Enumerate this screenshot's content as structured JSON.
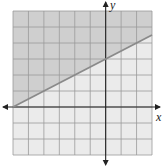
{
  "chart_data": {
    "type": "line",
    "title": "",
    "xlabel": "x",
    "ylabel": "y",
    "xlim": [
      -6,
      3
    ],
    "ylim": [
      -3,
      6
    ],
    "grid": true,
    "grid_step": 1,
    "tick_labels": false,
    "series": [
      {
        "name": "boundary line",
        "equation": "y = 0.5x + 3",
        "style": "solid",
        "x": [
          -6,
          3
        ],
        "y": [
          0,
          4.5
        ]
      }
    ],
    "shaded_region": {
      "side": "above",
      "inequality": "y >= 0.5x + 3",
      "color": "#cfcfcf"
    },
    "unshaded_color": "#ebebeb",
    "line_color": "#8a8a8a",
    "grid_color": "#9a9a9a",
    "axis_color": "#222222"
  },
  "labels": {
    "x_axis": "x",
    "y_axis": "y"
  }
}
